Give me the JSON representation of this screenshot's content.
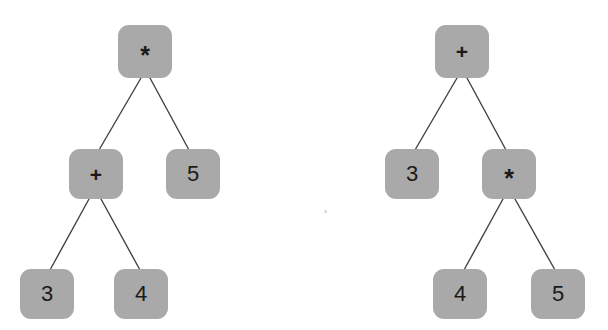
{
  "figure": {
    "background_color": "#ffffff",
    "node_fill_color": "#a9a9a9",
    "node_text_color": "#1a1a1a",
    "edge_color": "#434343",
    "edge_width": 1.4,
    "node_corner_radius": 11
  },
  "trees": [
    {
      "id": "left-tree",
      "name": "multiply-tree",
      "expression": "(3 + 4) * 5",
      "nodes": [
        {
          "id": "L1",
          "label": "*",
          "kind": "operator",
          "x": 118,
          "y": 25,
          "w": 54,
          "h": 53
        },
        {
          "id": "L2",
          "label": "+",
          "kind": "operator",
          "x": 69,
          "y": 149,
          "w": 54,
          "h": 50
        },
        {
          "id": "L3",
          "label": "5",
          "kind": "leaf",
          "x": 166,
          "y": 149,
          "w": 54,
          "h": 50
        },
        {
          "id": "L4",
          "label": "3",
          "kind": "leaf",
          "x": 20,
          "y": 269,
          "w": 54,
          "h": 50
        },
        {
          "id": "L5",
          "label": "4",
          "kind": "leaf",
          "x": 114,
          "y": 269,
          "w": 54,
          "h": 50
        }
      ],
      "edges": [
        {
          "from": "L1",
          "to": "L2",
          "x1": 141,
          "y1": 78,
          "x2": 99,
          "y2": 150
        },
        {
          "from": "L1",
          "to": "L3",
          "x1": 150,
          "y1": 78,
          "x2": 189,
          "y2": 150
        },
        {
          "from": "L2",
          "to": "L4",
          "x1": 89,
          "y1": 199,
          "x2": 50,
          "y2": 270
        },
        {
          "from": "L2",
          "to": "L5",
          "x1": 101,
          "y1": 199,
          "x2": 140,
          "y2": 270
        }
      ]
    },
    {
      "id": "right-tree",
      "name": "add-tree",
      "expression": "3 + (4 * 5)",
      "nodes": [
        {
          "id": "R1",
          "label": "+",
          "kind": "operator",
          "x": 435,
          "y": 25,
          "w": 54,
          "h": 53
        },
        {
          "id": "R2",
          "label": "3",
          "kind": "leaf",
          "x": 385,
          "y": 149,
          "w": 54,
          "h": 50
        },
        {
          "id": "R3",
          "label": "*",
          "kind": "operator",
          "x": 482,
          "y": 149,
          "w": 54,
          "h": 50
        },
        {
          "id": "R4",
          "label": "4",
          "kind": "leaf",
          "x": 433,
          "y": 269,
          "w": 54,
          "h": 50
        },
        {
          "id": "R5",
          "label": "5",
          "kind": "leaf",
          "x": 531,
          "y": 269,
          "w": 54,
          "h": 50
        }
      ],
      "edges": [
        {
          "from": "R1",
          "to": "R2",
          "x1": 457,
          "y1": 78,
          "x2": 415,
          "y2": 150
        },
        {
          "from": "R1",
          "to": "R3",
          "x1": 467,
          "y1": 78,
          "x2": 506,
          "y2": 150
        },
        {
          "from": "R3",
          "to": "R4",
          "x1": 503,
          "y1": 199,
          "x2": 464,
          "y2": 270
        },
        {
          "from": "R3",
          "to": "R5",
          "x1": 515,
          "y1": 199,
          "x2": 555,
          "y2": 270
        }
      ]
    }
  ],
  "artifacts": [
    {
      "name": "speck",
      "x": 324,
      "y": 210
    }
  ]
}
